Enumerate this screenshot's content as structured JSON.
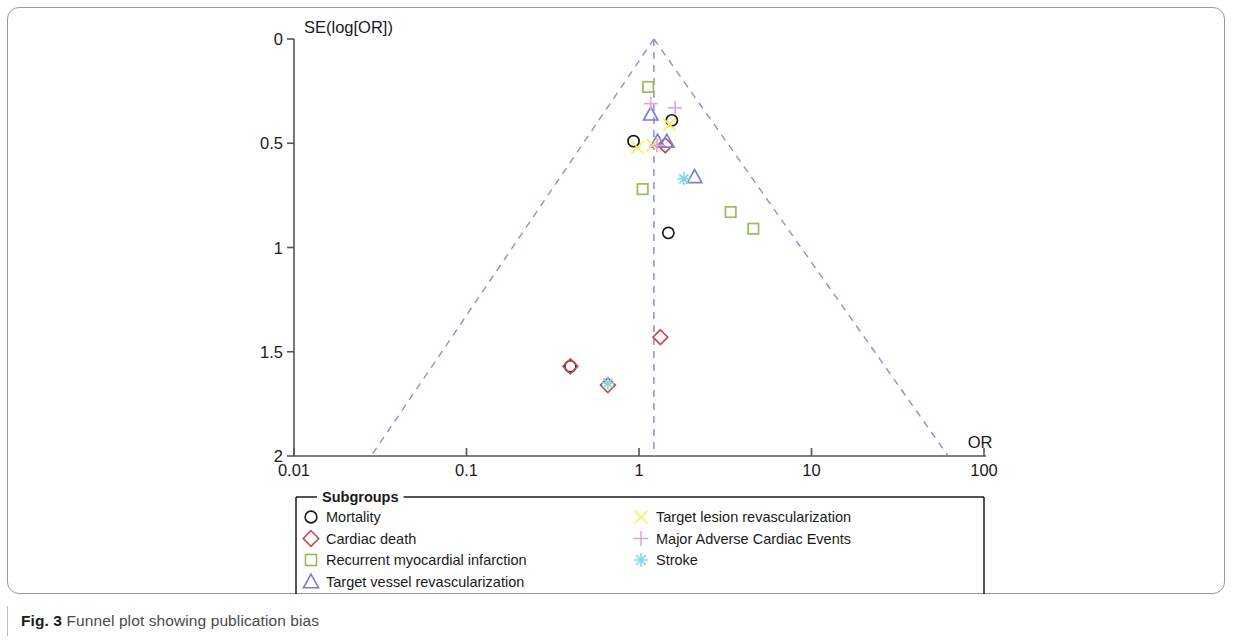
{
  "figure": {
    "caption_label": "Fig. 3",
    "caption_text": "Funnel plot showing publication bias"
  },
  "legend": {
    "title": "Subgroups",
    "left_column": [
      {
        "label": "Mortality",
        "marker": "circle",
        "color": "#1a1a1a"
      },
      {
        "label": "Cardiac death",
        "marker": "diamond",
        "color": "#c0504d"
      },
      {
        "label": "Recurrent myocardial infarction",
        "marker": "square",
        "color": "#9bbb59"
      },
      {
        "label": "Target vessel revascularization",
        "marker": "triangle",
        "color": "#7b7fd4"
      }
    ],
    "right_column": [
      {
        "label": "Target lesion revascularization",
        "marker": "cross-x",
        "color": "#f2f25a"
      },
      {
        "label": "Major Adverse Cardiac Events",
        "marker": "plus",
        "color": "#e7a6d8"
      },
      {
        "label": "Stroke",
        "marker": "asterisk",
        "color": "#7fd8e8"
      }
    ]
  },
  "chart_data": {
    "type": "scatter",
    "title": "",
    "xlabel": "OR",
    "ylabel": "SE(log[OR])",
    "xscale": "log",
    "xlim": [
      0.01,
      100
    ],
    "ylim": [
      0,
      2
    ],
    "y_inverted": true,
    "grid": false,
    "legend_position": "below-plot",
    "xticks": [
      "0.01",
      "0.1",
      "1",
      "10",
      "100"
    ],
    "xtick_values": [
      0.01,
      0.1,
      1,
      10,
      100
    ],
    "yticks": [
      "0",
      "0.5",
      "1",
      "1.5",
      "2"
    ],
    "ytick_values": [
      0,
      0.5,
      1,
      1.5,
      2
    ],
    "reference_line": {
      "x": 1.22,
      "style": "dashed",
      "color": "#8f8fd0"
    },
    "funnel_lines": {
      "style": "dashed",
      "color": "#8f8fd0",
      "apex": {
        "x": 1.22,
        "y": 0
      },
      "left_base": {
        "x": 0.028,
        "y": 2
      },
      "right_base": {
        "x": 62.0,
        "y": 2
      }
    },
    "series": [
      {
        "name": "Mortality",
        "marker": "circle",
        "color": "#1a1a1a",
        "points": [
          {
            "x": 1.55,
            "y": 0.39
          },
          {
            "x": 0.93,
            "y": 0.49
          },
          {
            "x": 1.48,
            "y": 0.93
          },
          {
            "x": 0.4,
            "y": 1.57
          }
        ]
      },
      {
        "name": "Cardiac death",
        "marker": "diamond",
        "color": "#c0504d",
        "points": [
          {
            "x": 1.42,
            "y": 0.51
          },
          {
            "x": 1.33,
            "y": 1.43
          },
          {
            "x": 0.4,
            "y": 1.57
          },
          {
            "x": 0.66,
            "y": 1.66
          }
        ]
      },
      {
        "name": "Recurrent myocardial infarction",
        "marker": "square",
        "color": "#9bbb59",
        "points": [
          {
            "x": 1.13,
            "y": 0.23
          },
          {
            "x": 1.05,
            "y": 0.72
          },
          {
            "x": 3.4,
            "y": 0.83
          },
          {
            "x": 4.6,
            "y": 0.91
          }
        ]
      },
      {
        "name": "Target vessel revascularization",
        "marker": "triangle",
        "color": "#7b7fd4",
        "points": [
          {
            "x": 1.17,
            "y": 0.36
          },
          {
            "x": 1.28,
            "y": 0.49
          },
          {
            "x": 1.45,
            "y": 0.49
          },
          {
            "x": 2.1,
            "y": 0.66
          }
        ]
      },
      {
        "name": "Target lesion revascularization",
        "marker": "cross-x",
        "color": "#f2f25a",
        "points": [
          {
            "x": 1.5,
            "y": 0.41
          },
          {
            "x": 1.2,
            "y": 0.51
          },
          {
            "x": 0.98,
            "y": 0.52
          }
        ]
      },
      {
        "name": "Major Adverse Cardiac Events",
        "marker": "plus",
        "color": "#e7a6d8",
        "points": [
          {
            "x": 1.17,
            "y": 0.31
          },
          {
            "x": 1.62,
            "y": 0.33
          },
          {
            "x": 1.27,
            "y": 0.51
          }
        ]
      },
      {
        "name": "Stroke",
        "marker": "asterisk",
        "color": "#7fd8e8",
        "points": [
          {
            "x": 1.82,
            "y": 0.67
          },
          {
            "x": 0.66,
            "y": 1.65
          }
        ]
      }
    ]
  }
}
